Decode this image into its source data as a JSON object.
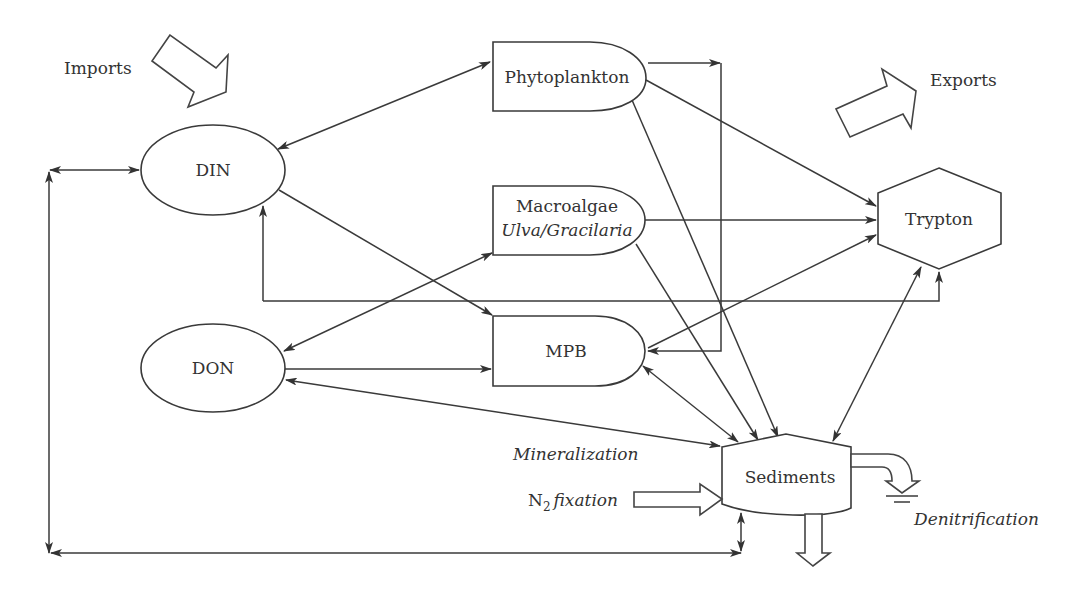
{
  "diagram": {
    "nodes": {
      "din": {
        "label": "DIN",
        "shape": "ellipse"
      },
      "don": {
        "label": "DON",
        "shape": "ellipse"
      },
      "phytoplankton": {
        "label": "Phytoplankton",
        "shape": "delay"
      },
      "macroalgae": {
        "label": "Macroalgae",
        "sublabel": "Ulva/Gracilaria",
        "shape": "delay"
      },
      "mpb": {
        "label": "MPB",
        "shape": "delay"
      },
      "trypton": {
        "label": "Trypton",
        "shape": "hexagon"
      },
      "sediments": {
        "label": "Sediments",
        "shape": "tank"
      }
    },
    "annotations": {
      "imports": "Imports",
      "exports": "Exports",
      "mineralization": "Mineralization",
      "n2_prefix": "N",
      "n2_subscript": "2",
      "n2_fixation": "fixation",
      "denitrification": "Denitrification"
    },
    "edges": [
      {
        "from": "din",
        "to": "phytoplankton",
        "direction": "both"
      },
      {
        "from": "din",
        "to": "mpb",
        "direction": "forward"
      },
      {
        "from": "din",
        "to": "trypton",
        "direction": "backward",
        "route": "orthogonal-below"
      },
      {
        "from": "din",
        "to": "sediments",
        "direction": "both",
        "route": "left-loop"
      },
      {
        "from": "don",
        "to": "macroalgae",
        "direction": "both"
      },
      {
        "from": "don",
        "to": "mpb",
        "direction": "forward"
      },
      {
        "from": "don",
        "to": "sediments",
        "direction": "both"
      },
      {
        "from": "phytoplankton",
        "to": "mpb",
        "direction": "forward",
        "route": "right-bracket"
      },
      {
        "from": "phytoplankton",
        "to": "trypton",
        "direction": "forward"
      },
      {
        "from": "phytoplankton",
        "to": "sediments",
        "direction": "forward"
      },
      {
        "from": "macroalgae",
        "to": "trypton",
        "direction": "forward"
      },
      {
        "from": "macroalgae",
        "to": "sediments",
        "direction": "forward"
      },
      {
        "from": "mpb",
        "to": "trypton",
        "direction": "forward"
      },
      {
        "from": "mpb",
        "to": "sediments",
        "direction": "both"
      },
      {
        "from": "trypton",
        "to": "sediments",
        "direction": "both"
      }
    ],
    "colors": {
      "stroke": "#3a3a3a",
      "text": "#333333",
      "background": "#ffffff"
    }
  }
}
